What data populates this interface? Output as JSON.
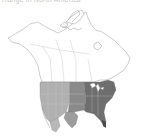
{
  "caption": "Range in North America",
  "map": {
    "region": "North America",
    "legend": [
      {
        "label": "Range (breeding/resident)",
        "color": "#8a8a8a"
      },
      {
        "label": "Range (darker core)",
        "color": "#6e6e6e"
      },
      {
        "label": "Range (lighter)",
        "color": "#b4b4b4"
      }
    ],
    "colors": {
      "land_outline": "#9a9a9a",
      "background": "#ffffff",
      "range_mid": "#8a8a8a",
      "range_dark": "#6c6c6c",
      "range_light": "#b8b8b8"
    }
  }
}
